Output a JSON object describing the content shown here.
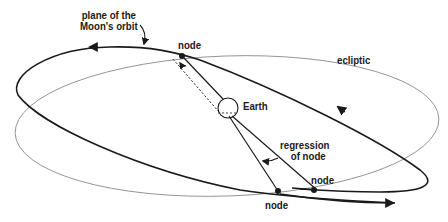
{
  "diagram": {
    "labels": {
      "plane_line1": "plane of the",
      "plane_line2": "Moon's orbit",
      "ecliptic": "ecliptic",
      "earth": "Earth",
      "node_top": "node",
      "node_right": "node",
      "node_bottom": "node",
      "regression_line1": "regression",
      "regression_line2": "of node"
    },
    "colors": {
      "moon_orbit": "#1a1a1a",
      "ecliptic": "#8a8a8a",
      "text": "#1a1a1a",
      "background": "#ffffff"
    },
    "points": {
      "earth_center": [
        228,
        108
      ],
      "node_top": [
        182,
        56
      ],
      "node_bottom": [
        278,
        191
      ],
      "node_right": [
        317,
        190
      ]
    }
  }
}
